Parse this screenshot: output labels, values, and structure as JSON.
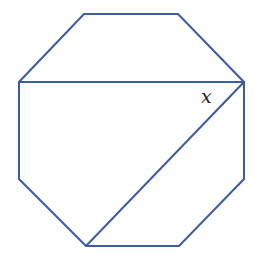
{
  "diagram": {
    "type": "geometry",
    "shape": "regular octagon",
    "stroke_color": "#3a5ba8",
    "stroke_width": 2,
    "vertices": [
      {
        "name": "top-left",
        "x": 84,
        "y": 14
      },
      {
        "name": "top-right",
        "x": 178,
        "y": 14
      },
      {
        "name": "right-top",
        "x": 244,
        "y": 82
      },
      {
        "name": "right-bottom",
        "x": 244,
        "y": 179
      },
      {
        "name": "bottom-right",
        "x": 179,
        "y": 246
      },
      {
        "name": "bottom-left",
        "x": 86,
        "y": 246
      },
      {
        "name": "left-bottom",
        "x": 19,
        "y": 179
      },
      {
        "name": "left-top",
        "x": 19,
        "y": 82
      }
    ],
    "diagonals": [
      {
        "name": "horizontal-diagonal",
        "from": "left-top",
        "to": "right-top"
      },
      {
        "name": "slanted-diagonal",
        "from": "right-top",
        "to": "bottom-left"
      }
    ],
    "angle_label": {
      "text": "x",
      "x": 201,
      "y": 103,
      "font_size": 19
    }
  }
}
